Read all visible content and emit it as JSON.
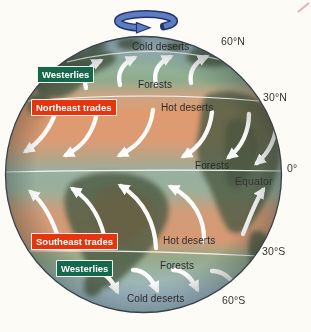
{
  "diagram": {
    "latitude_labels": {
      "n60": "60°N",
      "n30": "30°N",
      "eq_deg": "0°",
      "equator": "Equator",
      "s30": "30°S",
      "s60": "60°S"
    },
    "wind_belts": {
      "westerlies_north": "Westerlies",
      "northeast_trades": "Northeast trades",
      "southeast_trades": "Southeast trades",
      "westerlies_south": "Westerlies"
    },
    "biomes": {
      "cold_deserts_north": "Cold deserts",
      "forests_north": "Forests",
      "hot_deserts_north": "Hot deserts",
      "forests_equator": "Forests",
      "hot_deserts_south": "Hot deserts",
      "forests_south": "Forests",
      "cold_deserts_south": "Cold deserts"
    },
    "icons": {
      "rotation_icon": "earth-rotation-arrow",
      "wind_arrow_icon": "curved-wind-arrow"
    },
    "colors": {
      "westerlies_label_bg": "#17684a",
      "trades_label_bg": "#e5350f",
      "label_text": "#ffffff",
      "map_text": "#2b2b2b",
      "cold_desert_band": "#a7c0cd",
      "forest_band": "#8fac8c",
      "hot_desert_band": "#e09a6e",
      "equator_band": "#99afa0",
      "landmass": "#4e5c45",
      "wind_arrow": "#ffffff",
      "rotation_arrow_fill": "#5d7dc2",
      "rotation_arrow_outline": "#23346e",
      "latitude_line": "#ffffff"
    }
  }
}
